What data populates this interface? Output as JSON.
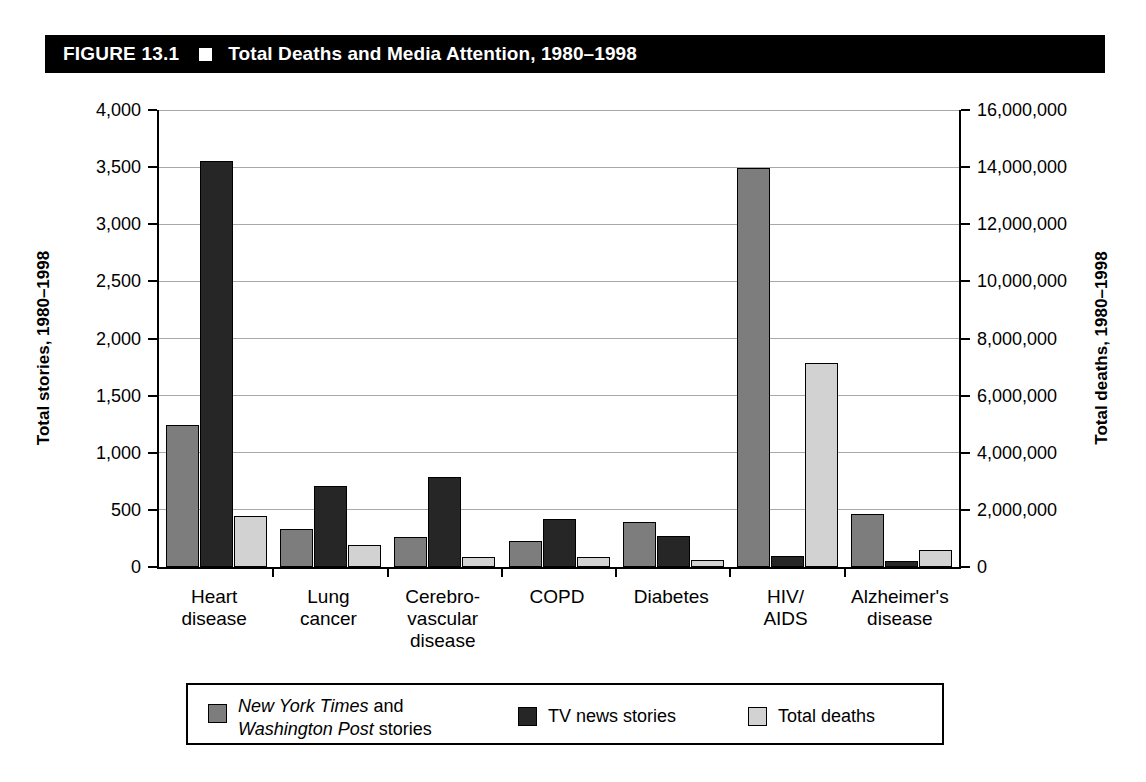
{
  "header": {
    "figure_number": "FIGURE 13.1",
    "marker": "white-square",
    "title": "Total Deaths and Media Attention, 1980–1998"
  },
  "axes": {
    "left_title": "Total stories, 1980–1998",
    "right_title": "Total deaths, 1980–1998",
    "left_ticks": [
      "0",
      "500",
      "1,000",
      "1,500",
      "2,000",
      "2,500",
      "3,000",
      "3,500",
      "4,000"
    ],
    "right_ticks": [
      "0",
      "2,000,000",
      "4,000,000",
      "6,000,000",
      "8,000,000",
      "10,000,000",
      "12,000,000",
      "14,000,000",
      "16,000,000"
    ]
  },
  "legend": {
    "items": [
      {
        "label": "New York Times and Washington Post stories",
        "italic_part": "New York Times",
        "italic_part2": "Washington Post",
        "color": "#7d7d7d"
      },
      {
        "label": "TV news stories",
        "color": "#262626"
      },
      {
        "label": "Total deaths",
        "color": "#d2d2d2"
      }
    ]
  },
  "chart_data": {
    "type": "bar",
    "title": "Total Deaths and Media Attention, 1980–1998",
    "xlabel": "",
    "ylabel": "Total stories, 1980–1998",
    "ylabel_secondary": "Total deaths, 1980–1998",
    "ylim": [
      0,
      4000
    ],
    "ylim_secondary": [
      0,
      16000000
    ],
    "grid": true,
    "legend_position": "bottom",
    "categories": [
      "Heart\ndisease",
      "Lung\ncancer",
      "Cerebro-\nvascular\ndisease",
      "COPD",
      "Diabetes",
      "HIV/\nAIDS",
      "Alzheimer's\ndisease"
    ],
    "categories_flat": [
      "Heart disease",
      "Lung cancer",
      "Cerebrovascular disease",
      "COPD",
      "Diabetes",
      "HIV/AIDS",
      "Alzheimer's disease"
    ],
    "series": [
      {
        "name": "New York Times and Washington Post stories",
        "axis": "left",
        "color": "#7d7d7d",
        "values": [
          1240,
          335,
          260,
          230,
          390,
          3490,
          465
        ]
      },
      {
        "name": "TV news stories",
        "axis": "left",
        "color": "#262626",
        "values": [
          3550,
          705,
          785,
          420,
          270,
          100,
          55
        ]
      },
      {
        "name": "Total deaths",
        "axis": "right",
        "color": "#d2d2d2",
        "values": [
          1790000,
          760000,
          360000,
          350000,
          260000,
          7160000,
          580000
        ],
        "values_on_left_scale": [
          448,
          190,
          90,
          88,
          65,
          1790,
          145
        ]
      }
    ]
  }
}
